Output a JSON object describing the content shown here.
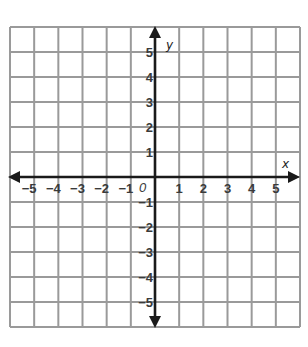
{
  "chart_data": {
    "type": "scatter",
    "title": "",
    "xlabel": "x",
    "ylabel": "y",
    "xlim": [
      -6,
      6
    ],
    "ylim": [
      -6,
      6
    ],
    "grid": true,
    "x_ticks": [
      -5,
      -4,
      -3,
      -2,
      -1,
      1,
      2,
      3,
      4,
      5
    ],
    "y_ticks": [
      -5,
      -4,
      -3,
      -2,
      -1,
      1,
      2,
      3,
      4,
      5
    ],
    "origin_label": "0",
    "series": [],
    "x_tick_labels": [
      "−5",
      "−4",
      "−3",
      "−2",
      "−1",
      "1",
      "2",
      "3",
      "4",
      "5"
    ],
    "y_tick_labels": [
      "5",
      "4",
      "3",
      "2",
      "1",
      "−1",
      "−2",
      "−3",
      "−4",
      "−5"
    ]
  },
  "colors": {
    "grid": "#9a9a9a",
    "axis": "#1a1a1a",
    "label": "#3a3a3a"
  }
}
